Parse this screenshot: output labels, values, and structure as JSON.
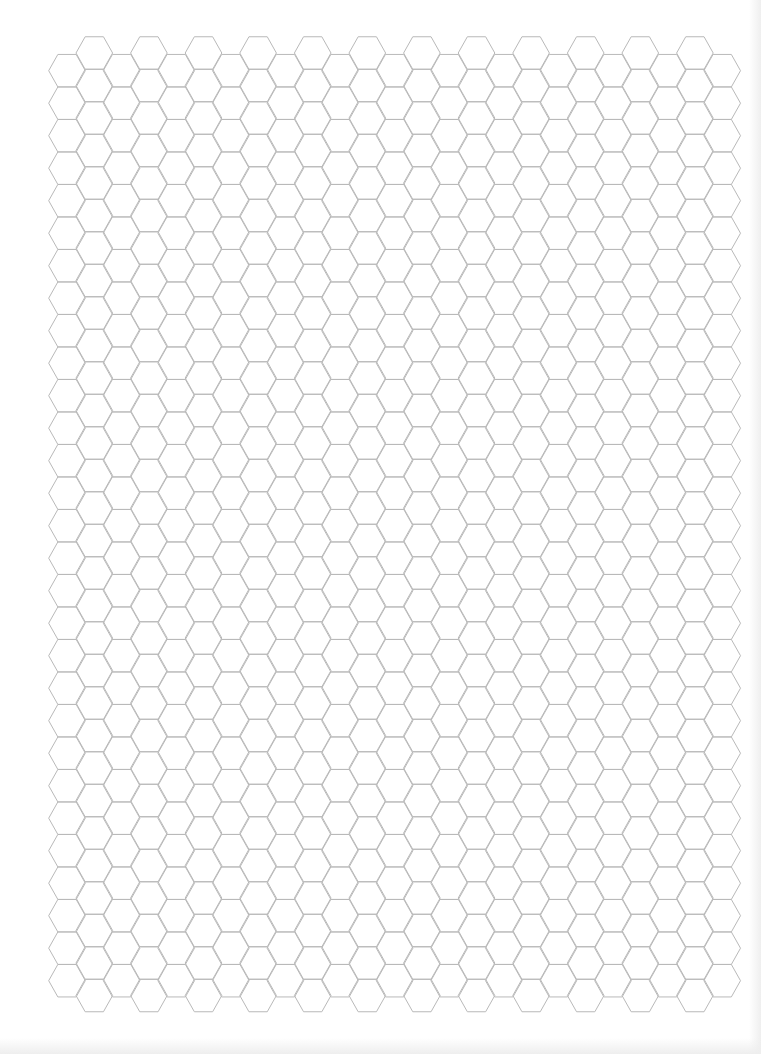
{
  "page": {
    "type": "hexagon-graph-paper",
    "width": 761,
    "height": 1054,
    "background_color": "#ffffff",
    "edge_shadow_color": "#eeeeee"
  },
  "grid": {
    "orientation": "flat-top",
    "line_color": "#b9b9b9",
    "line_width": 1,
    "hex_half_width": 18.3,
    "hex_half_height": 16.25,
    "column_step": 27.3,
    "row_step": 32.5,
    "lower_columns": {
      "count": 13,
      "first_center_x": 67.0,
      "first_center_y": 70.7,
      "rows": 29
    },
    "raised_columns": {
      "count": 12,
      "first_center_x": 94.3,
      "first_center_y": 53.0,
      "rows": 30
    }
  },
  "text": {}
}
